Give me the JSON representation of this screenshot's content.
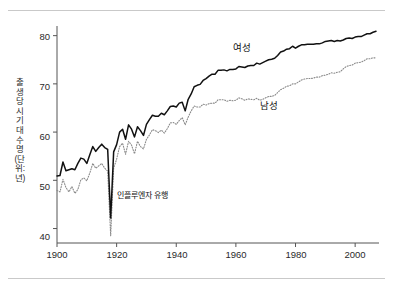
{
  "chart_data": {
    "type": "line",
    "title": "",
    "xlabel": "",
    "ylabel": "출생 당시 기대 수명(단위: 년)",
    "xlim": [
      1900,
      2008
    ],
    "ylim": [
      37,
      82
    ],
    "xticks": [
      1900,
      1920,
      1940,
      1960,
      1980,
      2000
    ],
    "yticks": [
      40,
      50,
      60,
      70,
      80
    ],
    "grid": false,
    "legend_position": "inline-annotations",
    "annotations": [
      {
        "text": "인플루엔자 유행",
        "x": 1918,
        "y": 44,
        "note": "sharp dip in both series at 1918"
      }
    ],
    "series": [
      {
        "name": "여성",
        "style": "solid",
        "color": "#111111",
        "x": [
          1900,
          1901,
          1902,
          1903,
          1904,
          1905,
          1906,
          1907,
          1908,
          1909,
          1910,
          1911,
          1912,
          1913,
          1914,
          1915,
          1916,
          1917,
          1918,
          1919,
          1920,
          1921,
          1922,
          1923,
          1924,
          1925,
          1926,
          1927,
          1928,
          1929,
          1930,
          1931,
          1932,
          1933,
          1934,
          1935,
          1936,
          1937,
          1938,
          1939,
          1940,
          1941,
          1942,
          1943,
          1944,
          1945,
          1946,
          1947,
          1948,
          1949,
          1950,
          1951,
          1952,
          1953,
          1954,
          1955,
          1956,
          1957,
          1958,
          1959,
          1960,
          1961,
          1962,
          1963,
          1964,
          1965,
          1966,
          1967,
          1968,
          1969,
          1970,
          1971,
          1972,
          1973,
          1974,
          1975,
          1976,
          1977,
          1978,
          1979,
          1980,
          1981,
          1982,
          1983,
          1984,
          1985,
          1986,
          1987,
          1988,
          1989,
          1990,
          1991,
          1992,
          1993,
          1994,
          1995,
          1996,
          1997,
          1998,
          1999,
          2000,
          2001,
          2002,
          2003,
          2004,
          2005,
          2006,
          2007
        ],
        "values": [
          50.9,
          51.0,
          53.8,
          52.0,
          52.2,
          52.4,
          52.2,
          53.5,
          54.6,
          54.4,
          53.5,
          55.3,
          57.0,
          56.0,
          56.8,
          57.5,
          56.8,
          56.4,
          42.2,
          55.9,
          57.4,
          60.0,
          60.6,
          58.5,
          61.5,
          60.6,
          59.0,
          61.1,
          60.3,
          59.3,
          61.6,
          62.6,
          63.5,
          63.3,
          63.3,
          63.9,
          63.6,
          64.4,
          65.3,
          65.4,
          65.2,
          66.0,
          66.2,
          64.4,
          66.8,
          67.9,
          69.4,
          69.7,
          69.9,
          70.7,
          71.1,
          71.6,
          72.0,
          72.0,
          72.8,
          72.8,
          72.9,
          72.7,
          73.0,
          73.0,
          73.1,
          73.6,
          73.5,
          73.4,
          73.7,
          73.8,
          73.8,
          74.3,
          74.1,
          74.4,
          74.7,
          75.0,
          75.1,
          75.3,
          75.9,
          76.6,
          76.8,
          77.2,
          77.3,
          77.8,
          77.4,
          77.8,
          78.1,
          78.1,
          78.2,
          78.2,
          78.2,
          78.3,
          78.3,
          78.5,
          78.8,
          78.9,
          79.0,
          78.8,
          79.0,
          78.9,
          79.1,
          79.4,
          79.5,
          79.4,
          79.7,
          79.8,
          79.8,
          80.1,
          80.4,
          80.4,
          80.7,
          80.9
        ]
      },
      {
        "name": "남성",
        "style": "dotted",
        "color": "#8a8a8a",
        "x": [
          1900,
          1901,
          1902,
          1903,
          1904,
          1905,
          1906,
          1907,
          1908,
          1909,
          1910,
          1911,
          1912,
          1913,
          1914,
          1915,
          1916,
          1917,
          1918,
          1919,
          1920,
          1921,
          1922,
          1923,
          1924,
          1925,
          1926,
          1927,
          1928,
          1929,
          1930,
          1931,
          1932,
          1933,
          1934,
          1935,
          1936,
          1937,
          1938,
          1939,
          1940,
          1941,
          1942,
          1943,
          1944,
          1945,
          1946,
          1947,
          1948,
          1949,
          1950,
          1951,
          1952,
          1953,
          1954,
          1955,
          1956,
          1957,
          1958,
          1959,
          1960,
          1961,
          1962,
          1963,
          1964,
          1965,
          1966,
          1967,
          1968,
          1969,
          1970,
          1971,
          1972,
          1973,
          1974,
          1975,
          1976,
          1977,
          1978,
          1979,
          1980,
          1981,
          1982,
          1983,
          1984,
          1985,
          1986,
          1987,
          1988,
          1989,
          1990,
          1991,
          1992,
          1993,
          1994,
          1995,
          1996,
          1997,
          1998,
          1999,
          2000,
          2001,
          2002,
          2003,
          2004,
          2005,
          2006,
          2007
        ],
        "values": [
          47.9,
          47.6,
          50.2,
          48.5,
          47.6,
          48.7,
          47.3,
          48.1,
          50.1,
          50.5,
          49.9,
          51.5,
          53.5,
          52.5,
          53.0,
          53.5,
          52.5,
          51.9,
          38.5,
          52.5,
          54.4,
          57.0,
          57.7,
          55.4,
          58.1,
          57.3,
          55.5,
          58.1,
          57.0,
          56.5,
          58.5,
          59.4,
          60.5,
          60.3,
          59.9,
          60.4,
          59.8,
          60.7,
          61.9,
          62.0,
          61.6,
          62.4,
          63.0,
          61.5,
          63.1,
          64.4,
          65.4,
          65.2,
          65.2,
          65.8,
          65.6,
          65.9,
          66.0,
          66.0,
          66.7,
          66.7,
          66.7,
          66.4,
          66.6,
          66.5,
          66.6,
          67.1,
          66.9,
          66.6,
          66.9,
          66.8,
          66.7,
          67.0,
          66.6,
          66.8,
          67.1,
          67.4,
          67.4,
          67.6,
          68.2,
          68.8,
          69.1,
          69.5,
          69.6,
          70.0,
          70.0,
          70.4,
          70.8,
          71.0,
          71.1,
          71.1,
          71.2,
          71.4,
          71.4,
          71.7,
          71.8,
          72.0,
          72.3,
          72.2,
          72.4,
          72.5,
          73.1,
          73.6,
          73.8,
          73.9,
          74.3,
          74.4,
          74.5,
          74.8,
          75.2,
          75.2,
          75.4,
          75.4
        ]
      }
    ]
  },
  "axis": {
    "ytick_labels": [
      "80",
      "70",
      "60",
      "50",
      "40"
    ],
    "xtick_labels": [
      "1900",
      "1920",
      "1940",
      "1960",
      "1980",
      "2000"
    ],
    "ylabel_text": "출생 당시 기대 수명(단위: 년)"
  },
  "labels": {
    "female": "여성",
    "male": "남성",
    "influenza": "인플루엔자 유행"
  },
  "colors": {
    "female_line": "#111111",
    "male_line": "#8a8a8a",
    "axis": "#555555",
    "rule": "#c9c9c9"
  }
}
